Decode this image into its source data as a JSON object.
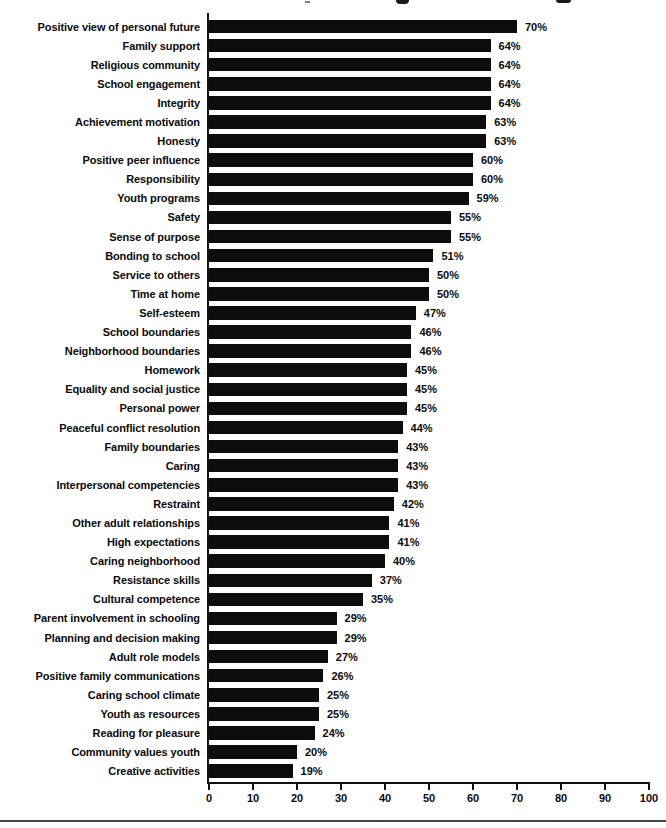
{
  "page": {
    "background": "#ffffff",
    "divider_color": "#454545"
  },
  "chart_data": {
    "type": "bar",
    "orientation": "horizontal",
    "title": "",
    "xlabel": "",
    "ylabel": "",
    "xlim": [
      0,
      100
    ],
    "x_ticks": [
      0,
      10,
      20,
      30,
      40,
      50,
      60,
      70,
      80,
      90,
      100
    ],
    "grid": false,
    "legend": false,
    "bar_color": "#0d0d0d",
    "value_suffix": "%",
    "categories": [
      "Positive view of personal future",
      "Family support",
      "Religious community",
      "School engagement",
      "Integrity",
      "Achievement motivation",
      "Honesty",
      "Positive peer influence",
      "Responsibility",
      "Youth programs",
      "Safety",
      "Sense of purpose",
      "Bonding to school",
      "Service to others",
      "Time at home",
      "Self-esteem",
      "School boundaries",
      "Neighborhood boundaries",
      "Homework",
      "Equality and social justice",
      "Personal power",
      "Peaceful conflict resolution",
      "Family boundaries",
      "Caring",
      "Interpersonal competencies",
      "Restraint",
      "Other adult relationships",
      "High expectations",
      "Caring neighborhood",
      "Resistance skills",
      "Cultural competence",
      "Parent involvement in schooling",
      "Planning and decision making",
      "Adult role models",
      "Positive family communications",
      "Caring school climate",
      "Youth as resources",
      "Reading for pleasure",
      "Community values youth",
      "Creative activities"
    ],
    "values": [
      70,
      64,
      64,
      64,
      64,
      63,
      63,
      60,
      60,
      59,
      55,
      55,
      51,
      50,
      50,
      47,
      46,
      46,
      45,
      45,
      45,
      44,
      43,
      43,
      43,
      42,
      41,
      41,
      40,
      37,
      35,
      29,
      29,
      27,
      26,
      25,
      25,
      24,
      20,
      19
    ]
  }
}
